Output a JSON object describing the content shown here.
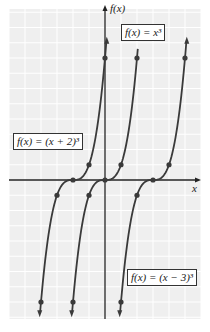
{
  "chart_data": {
    "type": "line",
    "title": "",
    "xlabel": "x",
    "ylabel": "f(x)",
    "grid": true,
    "xlim": [
      -6,
      6
    ],
    "ylim": [
      -9,
      11
    ],
    "series": [
      {
        "name": "f(x) = (x + 2)^3",
        "label": "f(x) = (x + 2)³",
        "points": [
          [
            -4,
            -8
          ],
          [
            -3,
            -1
          ],
          [
            -2,
            0
          ],
          [
            -1,
            1
          ],
          [
            0,
            8
          ]
        ],
        "arrows": "both"
      },
      {
        "name": "f(x) = x^3",
        "label": "f(x) = x³",
        "points": [
          [
            -2,
            -8
          ],
          [
            -1,
            -1
          ],
          [
            0,
            0
          ],
          [
            1,
            1
          ],
          [
            2,
            8
          ]
        ],
        "arrows": "bottom"
      },
      {
        "name": "f(x) = (x - 3)^3",
        "label": "f(x) = (x − 3)³",
        "points": [
          [
            1,
            -8
          ],
          [
            2,
            -1
          ],
          [
            3,
            0
          ],
          [
            4,
            1
          ],
          [
            5,
            8
          ]
        ],
        "arrows": "both"
      }
    ],
    "annotations": [
      "f(x) = x³",
      "f(x) = (x + 2)³",
      "f(x) = (x − 3)³"
    ]
  },
  "labels": {
    "y_axis": "f(x)",
    "x_axis": "x",
    "cube": "f(x) = x³",
    "shift_left": "f(x) = (x + 2)³",
    "shift_right": "f(x) = (x − 3)³"
  },
  "colors": {
    "plot_bg": "#efefef",
    "grid": "#ffffff",
    "curve": "#3a3a3a",
    "axis": "#222222"
  }
}
